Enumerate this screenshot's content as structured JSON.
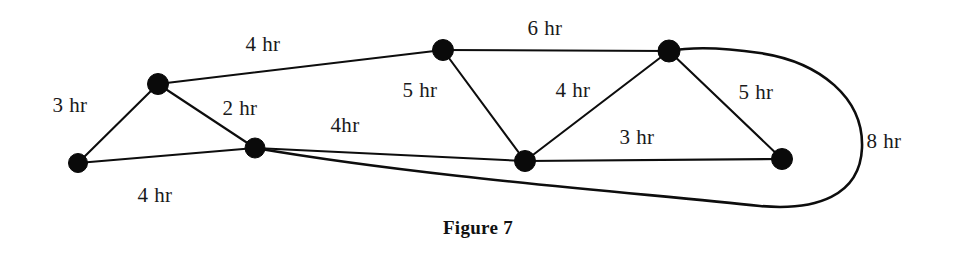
{
  "figure": {
    "caption": "Figure 7",
    "diagram_type": "weighted-undirected-graph",
    "unit": "hr",
    "canvas": {
      "width": 953,
      "height": 256
    },
    "colors": {
      "background": "#ffffff",
      "stroke": "#0d0d0d",
      "node_fill": "#0a0a0a",
      "text": "#1a1a1a"
    }
  },
  "nodes": [
    {
      "id": "A",
      "x": 78,
      "y": 163,
      "r": 9.5
    },
    {
      "id": "B",
      "x": 158,
      "y": 84,
      "r": 10.5
    },
    {
      "id": "C",
      "x": 255,
      "y": 148,
      "r": 10.0
    },
    {
      "id": "D",
      "x": 443,
      "y": 50,
      "r": 10.5
    },
    {
      "id": "E",
      "x": 525,
      "y": 161,
      "r": 10.5
    },
    {
      "id": "F",
      "x": 669,
      "y": 51,
      "r": 11.0
    },
    {
      "id": "G",
      "x": 782,
      "y": 159,
      "r": 10.5
    }
  ],
  "edges": [
    {
      "id": "e-AB",
      "from": "A",
      "to": "B",
      "weight": "3 hr",
      "shape": "line",
      "label_x": 70,
      "label_y": 105
    },
    {
      "id": "e-BD",
      "from": "B",
      "to": "D",
      "weight": "4 hr",
      "shape": "line",
      "label_x": 263,
      "label_y": 44
    },
    {
      "id": "e-BC",
      "from": "B",
      "to": "C",
      "weight": "2 hr",
      "shape": "line",
      "label_x": 240,
      "label_y": 108
    },
    {
      "id": "e-AC",
      "from": "A",
      "to": "C",
      "weight": "4 hr",
      "shape": "line",
      "label_x": 155,
      "label_y": 195
    },
    {
      "id": "e-CE",
      "from": "C",
      "to": "E",
      "weight": "4hr",
      "shape": "line",
      "label_x": 345,
      "label_y": 125
    },
    {
      "id": "e-DE",
      "from": "D",
      "to": "E",
      "weight": "5 hr",
      "shape": "line",
      "label_x": 420,
      "label_y": 90
    },
    {
      "id": "e-DF",
      "from": "D",
      "to": "F",
      "weight": "6 hr",
      "shape": "line",
      "label_x": 545,
      "label_y": 28
    },
    {
      "id": "e-EF",
      "from": "E",
      "to": "F",
      "weight": "4 hr",
      "shape": "line",
      "label_x": 573,
      "label_y": 90
    },
    {
      "id": "e-EG",
      "from": "E",
      "to": "G",
      "weight": "3 hr",
      "shape": "line",
      "label_x": 637,
      "label_y": 137
    },
    {
      "id": "e-FG",
      "from": "F",
      "to": "G",
      "weight": "5 hr",
      "shape": "line",
      "label_x": 756,
      "label_y": 92
    },
    {
      "id": "e-CF",
      "from": "C",
      "to": "F",
      "weight": "8 hr",
      "shape": "curve",
      "label_x": 884,
      "label_y": 141
    }
  ],
  "paths": {
    "e-AB": "M 78 163 L 158 84",
    "e-BD": "M 158 84 L 443 50",
    "e-BC": "M 158 84 L 255 148",
    "e-AC": "M 78 163 L 255 148",
    "e-CE": "M 255 148 L 525 161",
    "e-DE": "M 443 50 L 525 161",
    "e-DF": "M 443 50 L 669 51",
    "e-EF": "M 525 161 L 669 51",
    "e-EG": "M 525 161 L 782 159",
    "e-FG": "M 669 51 L 782 159",
    "e-CF": "M 255 148 C 430 178, 640 193, 760 206 C 816 211, 860 196, 862 148 C 864 98, 820 62, 760 53 C 720 47, 690 47, 669 51"
  }
}
